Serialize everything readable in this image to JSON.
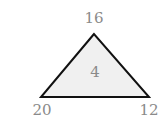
{
  "puzzle": {
    "shape": "triangle",
    "top": "16",
    "bottom_left": "20",
    "bottom_right": "12",
    "center": "4"
  },
  "colors": {
    "fill": "#f0f0f0",
    "stroke": "#111111",
    "text": "#8a8a8a"
  }
}
